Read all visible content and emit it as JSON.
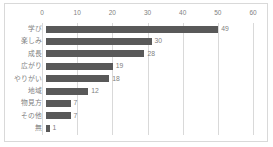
{
  "chart_data": {
    "type": "bar",
    "orientation": "horizontal",
    "title": "",
    "xlabel": "",
    "ylabel": "",
    "xlim": [
      0,
      60
    ],
    "xticks": [
      0,
      10,
      20,
      30,
      40,
      50,
      60
    ],
    "grid": true,
    "legend": false,
    "bar_color": "#595959",
    "gridline_color": "#d9d9d9",
    "text_color": "#7f7f7f",
    "categories": [
      "学び",
      "楽しみ",
      "成長",
      "広がり",
      "やりがい",
      "地域",
      "物見方",
      "その他",
      "無"
    ],
    "values": [
      49,
      30,
      28,
      19,
      18,
      12,
      7,
      7,
      1
    ],
    "data_labels": [
      "49",
      "30",
      "28",
      "19",
      "18",
      "12",
      "7",
      "7",
      "1"
    ]
  }
}
